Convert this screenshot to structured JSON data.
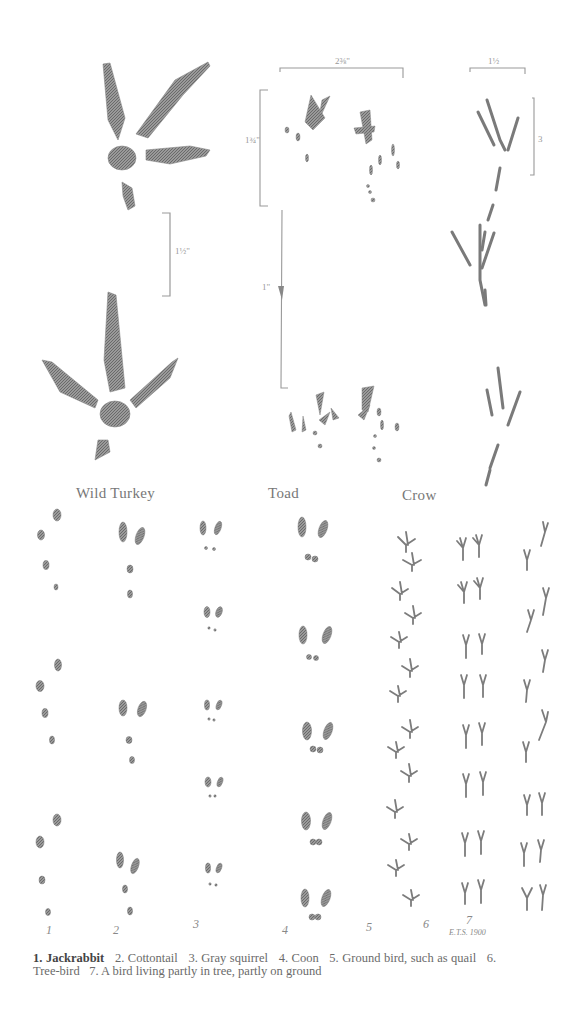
{
  "figure": {
    "top_section": {
      "labels": {
        "turkey": "Wild Turkey",
        "toad": "Toad",
        "crow": "Crow"
      },
      "measurements": {
        "turkey_gap": "1½\"",
        "toad_width": "2⅜\"",
        "toad_height": "1¾\"",
        "toad_stride": "1\"",
        "crow_width": "1½",
        "crow_height": "3"
      }
    },
    "track_grid": {
      "column_numbers": [
        "1",
        "2",
        "3",
        "4",
        "5",
        "6",
        "7"
      ],
      "signature": "E.T.S. 1900"
    },
    "caption": {
      "items": [
        {
          "num": "1.",
          "text": "Jackrabbit"
        },
        {
          "num": "2.",
          "text": "Cottontail"
        },
        {
          "num": "3.",
          "text": "Gray squirrel"
        },
        {
          "num": "4.",
          "text": "Coon"
        },
        {
          "num": "5.",
          "text": "Ground bird, such as quail"
        },
        {
          "num": "6.",
          "text": "Tree-bird"
        },
        {
          "num": "7.",
          "text": "A bird living partly in tree, partly on ground"
        }
      ]
    }
  }
}
